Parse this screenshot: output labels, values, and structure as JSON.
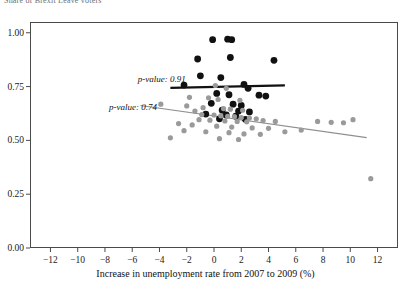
{
  "figure": {
    "clipped_title": "Share of Brexit Leave voters",
    "background": "#ffffff",
    "frame_color": "#4a4a4a"
  },
  "annotations": [
    {
      "text": "p-value: 0.91",
      "x": -5.6,
      "y": 0.787,
      "series": "black"
    },
    {
      "text": "p-value: 0.74",
      "x": -7.7,
      "y": 0.655,
      "series": "gray"
    }
  ],
  "chart_data": {
    "type": "scatter",
    "title": "",
    "xlabel": "Increase in unemployment rate from 2007 to 2009 (%)",
    "ylabel": "",
    "xlim": [
      -13.5,
      13.5
    ],
    "ylim": [
      0.0,
      1.05
    ],
    "xticks": [
      -12,
      -10,
      -8,
      -6,
      -4,
      -2,
      0,
      2,
      4,
      6,
      8,
      10,
      12
    ],
    "xticklabels": [
      "−12",
      "−10",
      "−8",
      "−6",
      "−4",
      "−2",
      "0",
      "2",
      "4",
      "6",
      "8",
      "10",
      "12"
    ],
    "yticks": [
      0.0,
      0.25,
      0.5,
      0.75,
      1.0
    ],
    "yticklabels": [
      "0.00",
      "0.25",
      "0.50",
      "0.75",
      "1.00"
    ],
    "grid": false,
    "legend": "none",
    "series": [
      {
        "name": "black-group",
        "color": "#111111",
        "marker": "circle",
        "marker_size": 3.4,
        "p_value": 0.91,
        "points": [
          [
            -0.1,
            0.968
          ],
          [
            1.0,
            0.97
          ],
          [
            1.3,
            0.968
          ],
          [
            -1.2,
            0.878
          ],
          [
            1.2,
            0.885
          ],
          [
            4.4,
            0.872
          ],
          [
            -1.0,
            0.8
          ],
          [
            0.5,
            0.792
          ],
          [
            -2.2,
            0.757
          ],
          [
            2.2,
            0.76
          ],
          [
            2.5,
            0.742
          ],
          [
            0.2,
            0.718
          ],
          [
            1.1,
            0.712
          ],
          [
            3.3,
            0.71
          ],
          [
            3.8,
            0.706
          ],
          [
            -0.2,
            0.672
          ],
          [
            1.4,
            0.668
          ],
          [
            2.0,
            0.662
          ],
          [
            0.6,
            0.64
          ],
          [
            1.8,
            0.636
          ],
          [
            2.6,
            0.632
          ],
          [
            -0.6,
            0.622
          ],
          [
            0.9,
            0.618
          ],
          [
            1.6,
            0.612
          ],
          [
            0.4,
            0.6
          ],
          [
            2.3,
            0.598
          ]
        ]
      },
      {
        "name": "gray-group",
        "color": "#9a9a9a",
        "marker": "circle",
        "marker_size": 2.6,
        "p_value": 0.74,
        "points": [
          [
            0.1,
            0.755
          ],
          [
            0.9,
            0.742
          ],
          [
            -1.8,
            0.7
          ],
          [
            -0.4,
            0.698
          ],
          [
            0.3,
            0.69
          ],
          [
            1.9,
            0.686
          ],
          [
            -3.9,
            0.668
          ],
          [
            -2.0,
            0.66
          ],
          [
            -0.8,
            0.652
          ],
          [
            0.7,
            0.648
          ],
          [
            1.2,
            0.645
          ],
          [
            2.1,
            0.64
          ],
          [
            -1.4,
            0.636
          ],
          [
            -0.9,
            0.62
          ],
          [
            0.0,
            0.618
          ],
          [
            0.5,
            0.614
          ],
          [
            1.0,
            0.612
          ],
          [
            1.5,
            0.61
          ],
          [
            2.0,
            0.606
          ],
          [
            2.6,
            0.604
          ],
          [
            3.1,
            0.6
          ],
          [
            -1.1,
            0.596
          ],
          [
            -0.3,
            0.594
          ],
          [
            0.8,
            0.59
          ],
          [
            1.7,
            0.588
          ],
          [
            2.4,
            0.586
          ],
          [
            3.6,
            0.592
          ],
          [
            4.5,
            0.588
          ],
          [
            -2.6,
            0.578
          ],
          [
            -1.6,
            0.572
          ],
          [
            0.2,
            0.566
          ],
          [
            1.3,
            0.562
          ],
          [
            2.8,
            0.558
          ],
          [
            4.0,
            0.556
          ],
          [
            -2.2,
            0.545
          ],
          [
            -0.6,
            0.54
          ],
          [
            1.1,
            0.536
          ],
          [
            2.2,
            0.53
          ],
          [
            3.4,
            0.528
          ],
          [
            5.2,
            0.54
          ],
          [
            -3.2,
            0.512
          ],
          [
            0.4,
            0.508
          ],
          [
            1.8,
            0.504
          ],
          [
            7.6,
            0.588
          ],
          [
            8.6,
            0.584
          ],
          [
            9.5,
            0.582
          ],
          [
            10.2,
            0.596
          ],
          [
            6.4,
            0.548
          ],
          [
            11.5,
            0.322
          ]
        ]
      }
    ],
    "trend_lines": [
      {
        "name": "black-trend",
        "color": "#111111",
        "width": 2.2,
        "x0": -3.2,
        "y0": 0.744,
        "x1": 5.2,
        "y1": 0.756,
        "p_value": 0.91
      },
      {
        "name": "gray-trend",
        "color": "#8f8f8f",
        "width": 1.1,
        "x0": -5.4,
        "y0": 0.662,
        "x1": 11.2,
        "y1": 0.513,
        "p_value": 0.74
      }
    ]
  }
}
